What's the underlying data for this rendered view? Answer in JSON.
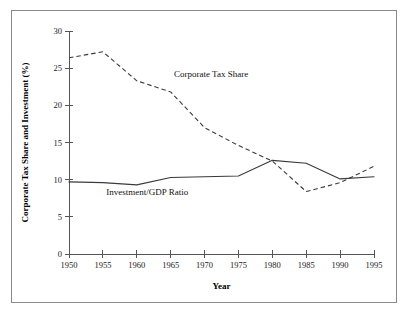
{
  "chart_data": {
    "type": "line",
    "title": "",
    "xlabel": "Year",
    "ylabel": "Corporate Tax Share and Investment (%)",
    "x": [
      1950,
      1955,
      1960,
      1965,
      1970,
      1975,
      1980,
      1985,
      1990,
      1995
    ],
    "xlim": [
      1950,
      1995
    ],
    "ylim": [
      0,
      30
    ],
    "xticks": [
      1950,
      1955,
      1960,
      1965,
      1970,
      1975,
      1980,
      1985,
      1990,
      1995
    ],
    "xticklabels": [
      "1950",
      "1955",
      "1960",
      "1965",
      "1970",
      "1975",
      "1980",
      "1985",
      "1990",
      "1995"
    ],
    "yticks": [
      0,
      5,
      10,
      15,
      20,
      25,
      30
    ],
    "yticklabels": [
      "0",
      "5",
      "10",
      "15",
      "20",
      "25",
      "30"
    ],
    "grid": false,
    "legend_position": "inline-annotations",
    "series": [
      {
        "name": "Corporate Tax Share",
        "style": "dashed",
        "label_x": 1965.5,
        "label_y": 23.8,
        "values": [
          26.4,
          27.2,
          23.3,
          21.8,
          17.0,
          14.6,
          12.5,
          8.4,
          9.6,
          11.8
        ]
      },
      {
        "name": "Investment/GDP Ratio",
        "style": "solid",
        "label_x": 1955.5,
        "label_y": 7.9,
        "values": [
          9.7,
          9.6,
          9.3,
          10.3,
          10.4,
          10.5,
          12.6,
          12.2,
          10.1,
          10.4
        ]
      }
    ]
  }
}
